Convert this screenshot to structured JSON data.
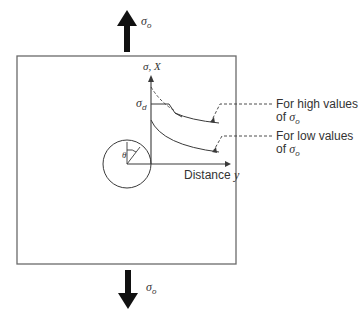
{
  "diagram": {
    "type": "stress field near circular hole in plate under uniaxial tension",
    "applied_stress_top": {
      "symbol": "σ",
      "subscript": "o"
    },
    "applied_stress_bottom": {
      "symbol": "σ",
      "subscript": "o"
    },
    "y_axis_label": {
      "text": "σ, X"
    },
    "level_label": {
      "symbol": "σ",
      "subscript": "d"
    },
    "x_axis_label": {
      "text": "Distance ",
      "var": "y"
    },
    "hole_angle_label": "θ",
    "annotations": [
      {
        "line1": "For high values",
        "line2": "of ",
        "symbol": "σ",
        "subscript": "o"
      },
      {
        "line1": "For low values",
        "line2": "of ",
        "symbol": "σ",
        "subscript": "o"
      }
    ],
    "colors": {
      "line": "#3a3a3a",
      "frame": "#6a6a6a",
      "arrow": "#111111"
    }
  }
}
